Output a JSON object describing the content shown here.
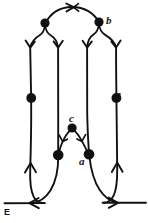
{
  "figure": {
    "kind": "directed-graph-diagram",
    "background_color": "#ffffff",
    "stroke_color": "#111111",
    "vertex_color": "#111111",
    "width": 148,
    "height": 223,
    "labels": {
      "b": "b",
      "d": "d",
      "c": "c",
      "a": "a",
      "E": "E"
    },
    "vertices": [
      {
        "id": "v-top-left",
        "label": "",
        "x": 45,
        "y": 23,
        "r": 4.6
      },
      {
        "id": "v-top-right",
        "label": "b",
        "x": 99,
        "y": 22,
        "r": 4.6
      },
      {
        "id": "v-mid-left",
        "label": "",
        "x": 32,
        "y": 98,
        "r": 4.8
      },
      {
        "id": "v-mid-right",
        "label": "d",
        "x": 113,
        "y": 98,
        "r": 4.8
      },
      {
        "id": "v-apex-c",
        "label": "c",
        "x": 72,
        "y": 128,
        "r": 4.6
      },
      {
        "id": "v-low-left",
        "label": "",
        "x": 58,
        "y": 155,
        "r": 5.2
      },
      {
        "id": "v-low-right",
        "label": "a",
        "x": 89,
        "y": 154,
        "r": 5.2
      }
    ],
    "strands": [
      {
        "id": "strand-1",
        "x": 30,
        "top": 48,
        "bottom": 170
      },
      {
        "id": "strand-2",
        "x": 58,
        "top": 48,
        "bottom": 150
      },
      {
        "id": "strand-3",
        "x": 87,
        "top": 48,
        "bottom": 150
      },
      {
        "id": "strand-4",
        "x": 116,
        "top": 48,
        "bottom": 170
      }
    ],
    "arrowheads": [
      {
        "id": "apex-arrow-top",
        "direction": "right",
        "x": 72,
        "y": 10
      },
      {
        "id": "chevron-strand-1",
        "direction": "down",
        "x": 30,
        "y": 48
      },
      {
        "id": "chevron-strand-2",
        "direction": "down",
        "x": 58,
        "y": 48
      },
      {
        "id": "chevron-strand-3",
        "direction": "down",
        "x": 87,
        "y": 48
      },
      {
        "id": "chevron-strand-4",
        "direction": "down",
        "x": 116,
        "y": 48
      },
      {
        "id": "chevron-arc-c-left",
        "direction": "down-left",
        "x": 63,
        "y": 140
      },
      {
        "id": "chevron-arc-c-right",
        "direction": "down-right",
        "x": 83,
        "y": 140
      },
      {
        "id": "up-arrow-left",
        "direction": "up",
        "x": 30,
        "y": 164
      },
      {
        "id": "up-arrow-right",
        "direction": "up",
        "x": 117,
        "y": 163
      },
      {
        "id": "baseline-arrow-left",
        "direction": "left",
        "x": 32,
        "y": 203
      },
      {
        "id": "baseline-arrow-right",
        "direction": "right",
        "x": 115,
        "y": 202
      }
    ],
    "baseline": {
      "id": "baseline-E",
      "y": 203,
      "left_segment": {
        "x1": 4,
        "x2": 40
      },
      "right_segment": {
        "x1": 108,
        "x2": 146
      }
    }
  }
}
